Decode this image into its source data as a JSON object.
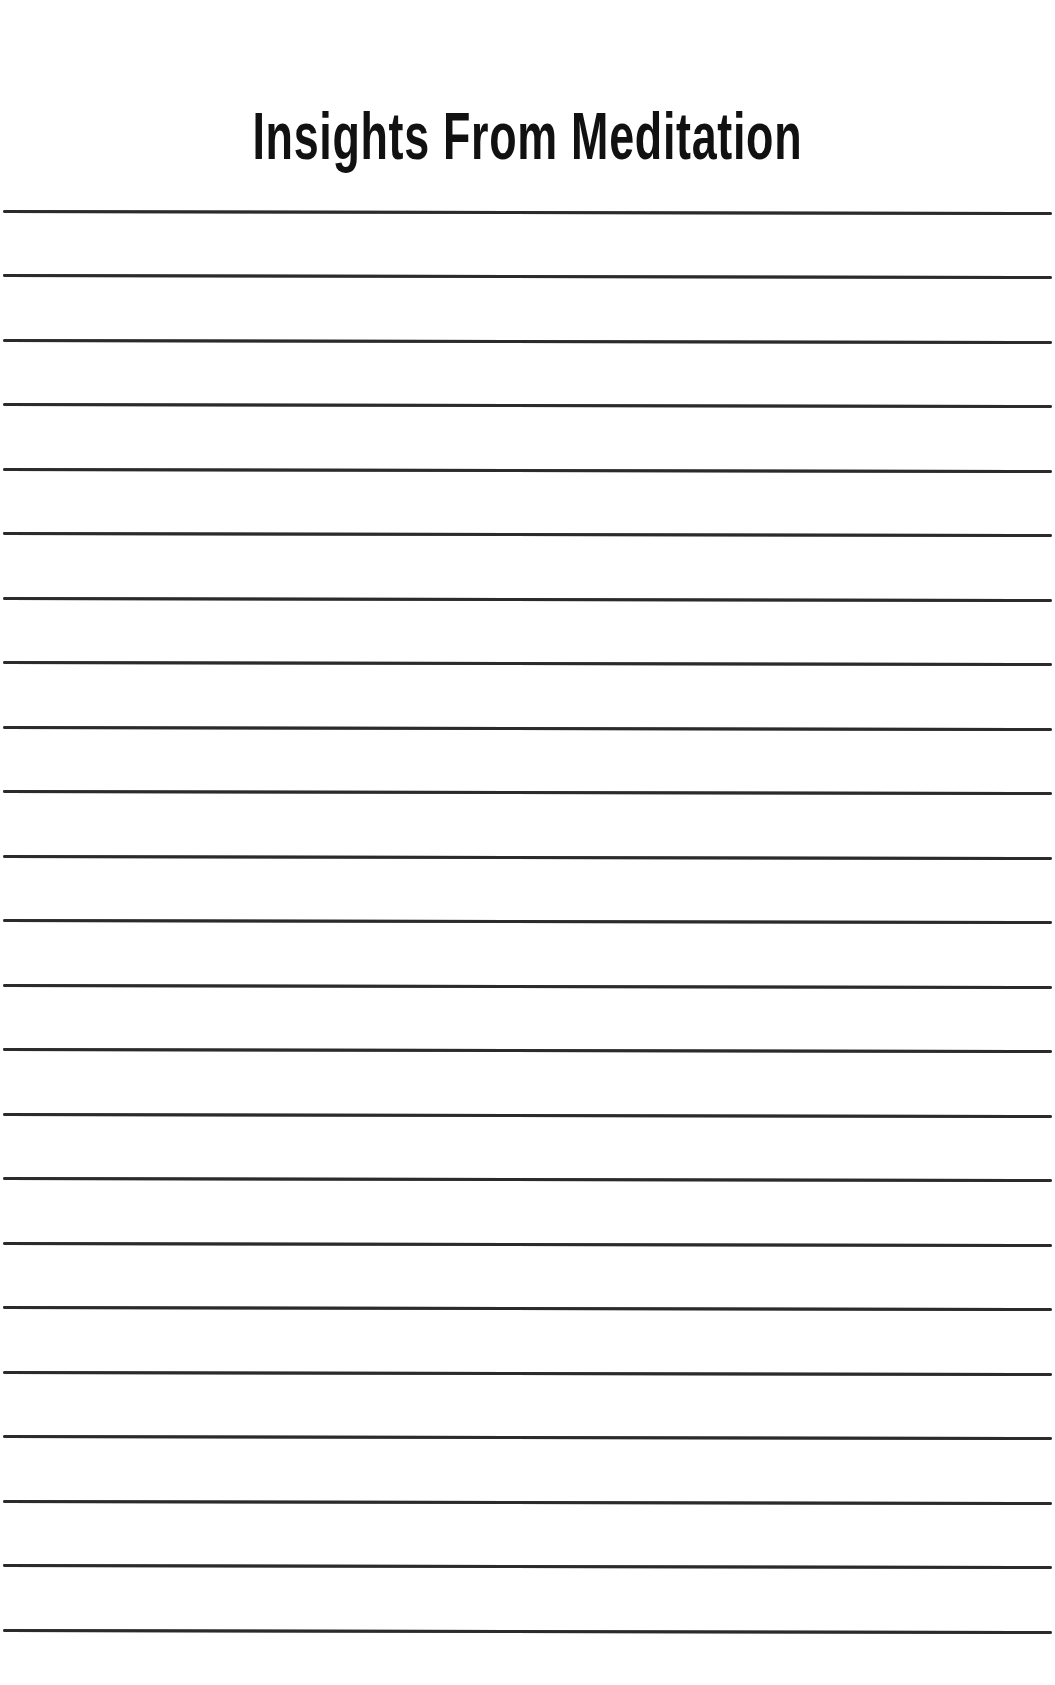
{
  "page": {
    "title": "Insights From Meditation",
    "line_color": "#2b2b2b",
    "background": "#ffffff"
  },
  "ruled_lines": {
    "count": 23,
    "first_y": 211,
    "spacing": 64.5
  }
}
